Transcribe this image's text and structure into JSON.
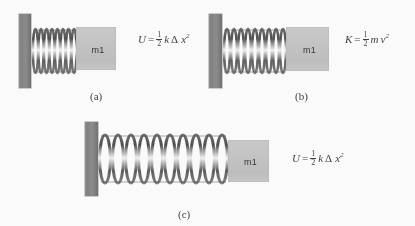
{
  "figure": {
    "background_color": "#fdfdfd",
    "wall_color": "#808080",
    "mass_color": "#c3c3c3",
    "text_color": "#3c3c3c"
  },
  "panels": [
    {
      "id": "a",
      "caption": "(a)",
      "mass_label": "m1",
      "spring_state": "compressed",
      "coil_count": 8,
      "equation": {
        "lhs": "U",
        "equals": "=",
        "fraction": {
          "numerator": "1",
          "denominator": "2"
        },
        "terms": "k",
        "delta": "Δ",
        "variable": "x",
        "exponent": "2",
        "plain": "U = 1/2 k Δx²"
      }
    },
    {
      "id": "b",
      "caption": "(b)",
      "mass_label": "m1",
      "spring_state": "natural",
      "coil_count": 9,
      "equation": {
        "lhs": "K",
        "equals": "=",
        "fraction": {
          "numerator": "1",
          "denominator": "2"
        },
        "terms": "m",
        "delta": "",
        "variable": "v",
        "exponent": "2",
        "plain": "K = 1/2 m v²"
      }
    },
    {
      "id": "c",
      "caption": "(c)",
      "mass_label": "m1",
      "spring_state": "stretched",
      "coil_count": 9,
      "equation": {
        "lhs": "U",
        "equals": "=",
        "fraction": {
          "numerator": "1",
          "denominator": "2"
        },
        "terms": "k",
        "delta": "Δ",
        "variable": "x",
        "exponent": "2",
        "plain": "U = 1/2 k Δx²"
      }
    }
  ]
}
